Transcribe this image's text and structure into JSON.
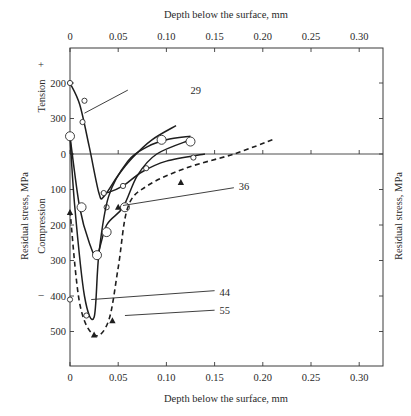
{
  "chart_data": {
    "type": "line",
    "title": "",
    "xlabel_top": "Depth below the surface, mm",
    "xlabel_bottom": "Depth below the surface, mm",
    "ylabel_left": "Residual stress, MPa",
    "ylabel_right": "Residual stress, MPa",
    "tension_label": "Tension",
    "tension_sign": "+",
    "compression_label": "Compression",
    "compression_sign": "–",
    "x_ticks": [
      "0",
      "0.05",
      "0.10",
      "0.15",
      "0.20",
      "0.25",
      "0.30"
    ],
    "x_tick_values": [
      0,
      0.05,
      0.1,
      0.15,
      0.2,
      0.25,
      0.3
    ],
    "xlim": [
      0,
      0.33
    ],
    "y_ticks_tension": [
      {
        "label": "200",
        "value": -200
      },
      {
        "label": "300",
        "value": -100
      }
    ],
    "y_ticks_compression": [
      {
        "label": "0",
        "value": 0
      },
      {
        "label": "100",
        "value": 100
      },
      {
        "label": "200",
        "value": 200
      },
      {
        "label": "300",
        "value": 300
      },
      {
        "label": "400",
        "value": 400
      },
      {
        "label": "500",
        "value": 500
      }
    ],
    "ylim": [
      -300,
      600
    ],
    "y_note": "compression plotted downward as positive; tension upward",
    "grid": false,
    "series": [
      {
        "name": "29",
        "style": "solid",
        "marker": "small-circle",
        "x": [
          0.0,
          0.01,
          0.02,
          0.03,
          0.035,
          0.05,
          0.065,
          0.085,
          0.11
        ],
        "y": [
          -200,
          -140,
          -20,
          110,
          120,
          60,
          10,
          -40,
          -80
        ],
        "points": [
          [
            0.0,
            -200
          ],
          [
            0.015,
            -150
          ],
          [
            0.013,
            -90
          ]
        ]
      },
      {
        "name": "36",
        "style": "solid",
        "marker": "small-circle",
        "x": [
          0.032,
          0.04,
          0.055,
          0.075,
          0.1,
          0.14
        ],
        "y": [
          110,
          108,
          90,
          50,
          20,
          0
        ],
        "points": [
          [
            0.035,
            110
          ],
          [
            0.038,
            150
          ],
          [
            0.055,
            90
          ],
          [
            0.079,
            40
          ],
          [
            0.128,
            10
          ]
        ]
      },
      {
        "name": "44",
        "style": "solid",
        "marker": "small-circle",
        "x": [
          0.0,
          0.005,
          0.015,
          0.025,
          0.03,
          0.04,
          0.06,
          0.08,
          0.1,
          0.125
        ],
        "y": [
          -50,
          150,
          400,
          460,
          280,
          120,
          20,
          -20,
          -40,
          -50
        ],
        "points": [
          [
            0.0,
            410
          ],
          [
            0.017,
            455
          ],
          [
            0.028,
            285
          ]
        ]
      },
      {
        "name": "large-circles",
        "style": "solid",
        "marker": "large-circle",
        "x": [
          0.0,
          0.01,
          0.02,
          0.028,
          0.038,
          0.055,
          0.07,
          0.09,
          0.125
        ],
        "y": [
          -50,
          150,
          250,
          285,
          200,
          150,
          60,
          0,
          -40
        ],
        "points": [
          [
            0.0,
            -50
          ],
          [
            0.012,
            150
          ],
          [
            0.028,
            285
          ],
          [
            0.038,
            220
          ],
          [
            0.057,
            150
          ],
          [
            0.095,
            -40
          ],
          [
            0.125,
            -35
          ]
        ]
      },
      {
        "name": "55",
        "style": "dashed",
        "marker": "filled-triangle",
        "x": [
          0.0,
          0.01,
          0.025,
          0.04,
          0.05,
          0.06,
          0.08,
          0.12,
          0.17,
          0.21
        ],
        "y": [
          160,
          420,
          510,
          470,
          320,
          150,
          90,
          40,
          0,
          -40
        ],
        "points": [
          [
            0.0,
            165
          ],
          [
            0.025,
            510
          ],
          [
            0.044,
            470
          ],
          [
            0.05,
            150
          ],
          [
            0.115,
            80
          ]
        ]
      }
    ],
    "annotations": [
      {
        "text": "29",
        "x": 0.125,
        "y": -180
      },
      {
        "text": "36",
        "x": 0.175,
        "y": 90
      },
      {
        "text": "44",
        "x": 0.155,
        "y": 390
      },
      {
        "text": "55",
        "x": 0.155,
        "y": 440
      }
    ],
    "legend": "none (curves labelled inline: 29, 36, 44, 55)"
  }
}
